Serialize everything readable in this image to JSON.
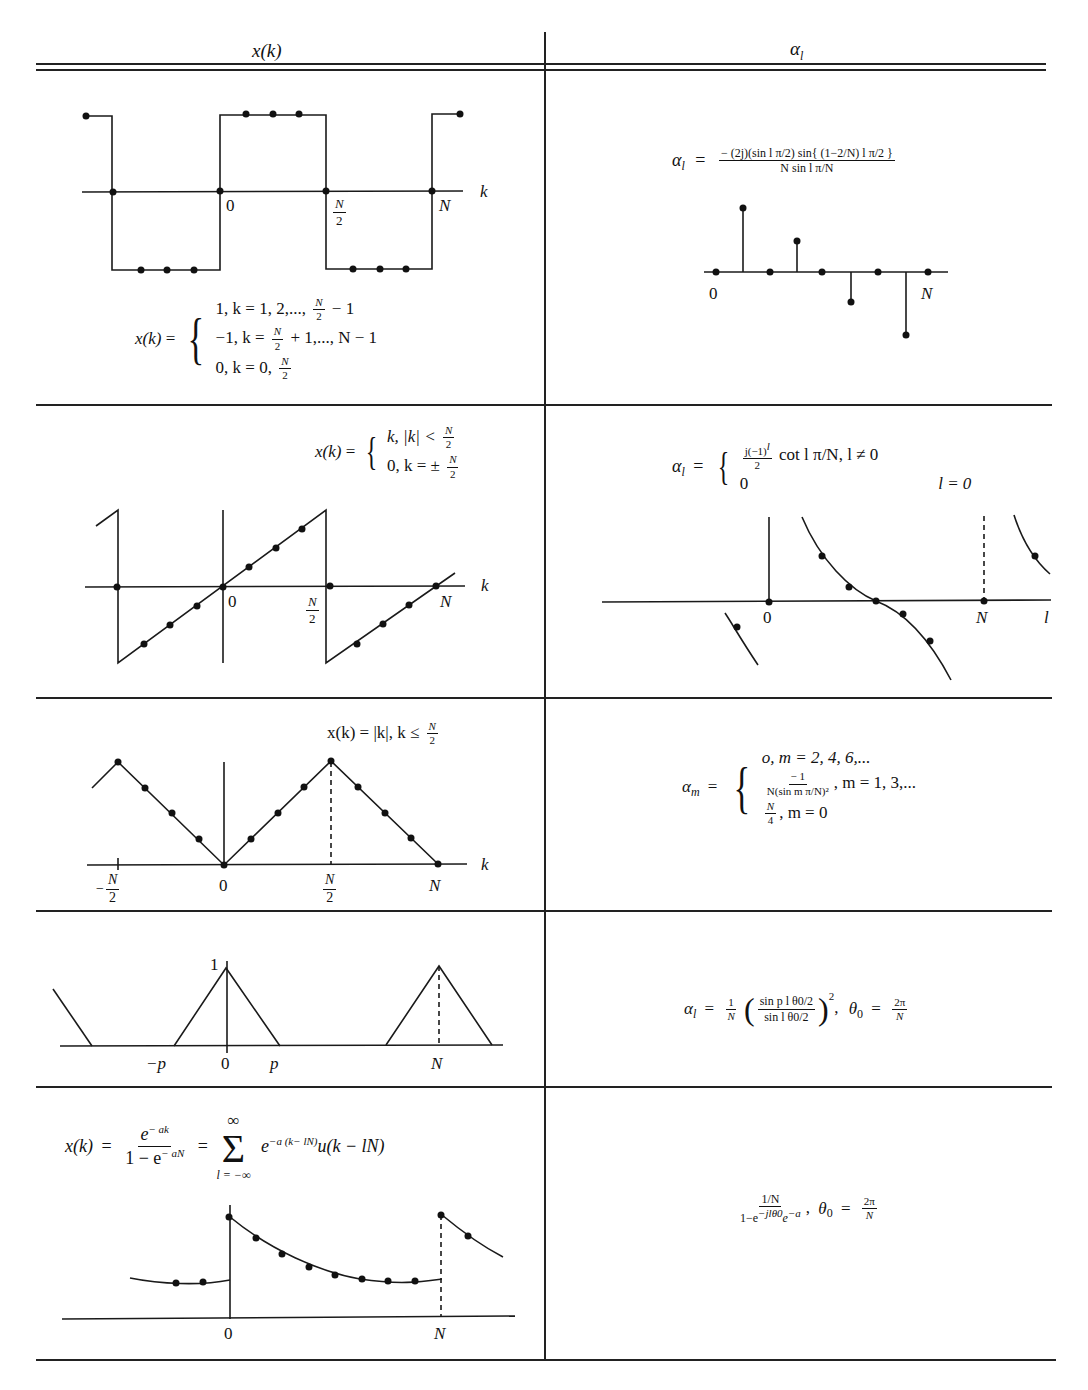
{
  "table": {
    "headers": {
      "left": "x(k)",
      "right": "αl"
    },
    "rows": [
      {
        "left": {
          "figure": "square-wave",
          "axis_labels": {
            "zero": "0",
            "half": "N",
            "half_den": "2",
            "n": "N",
            "k": "k"
          },
          "definition_lhs": "x(k) =",
          "cases": [
            "1, k = 1, 2,..., N/2 − 1",
            "−1, k = N/2 + 1,..., N − 1",
            "0, k = 0, N/2"
          ]
        },
        "right": {
          "formula_lhs": "αl =",
          "formula_num": "− (2j)(sin l π/2) sin{ (1−2/N) l π/2 }",
          "formula_den": "N sin l π/N",
          "figure": "stem-plot",
          "axis_labels": {
            "zero": "0",
            "n": "N"
          }
        }
      },
      {
        "left": {
          "figure": "sawtooth",
          "definition_lhs": "x(k) =",
          "cases": [
            "k, |k| < N/2",
            "0, k = ± N/2"
          ],
          "axis_labels": {
            "zero": "0",
            "half": "N",
            "half_den": "2",
            "n": "N",
            "k": "k"
          }
        },
        "right": {
          "formula_lhs": "αl =",
          "cases": [
            "j(−1)^l / 2  cot l π/N,  l ≠ 0",
            "0   l = 0"
          ],
          "figure": "cotangent",
          "axis_labels": {
            "zero": "0",
            "n": "N",
            "l": "l"
          }
        }
      },
      {
        "left": {
          "figure": "triangle-wave",
          "definition": "x(k) = |k|, k ≤ N/2",
          "axis_labels": {
            "neg_half": "−N/2",
            "zero": "0",
            "half": "N/2",
            "n": "N",
            "k": "k"
          }
        },
        "right": {
          "formula_lhs": "αm =",
          "cases": [
            "o, m = 2, 4, 6,...",
            "−1 / N(sin m π/N)² ,  m = 1, 3,...",
            "N/4 ,  m = 0"
          ]
        }
      },
      {
        "left": {
          "figure": "triangle-pulses",
          "axis_labels": {
            "one": "1",
            "neg_p": "−p",
            "zero": "0",
            "p": "p",
            "n": "N"
          }
        },
        "right": {
          "formula": "αl = 1/N ( sin p l θ0/2 / sin l θ0/2 )²,  θ0 = 2π/N"
        }
      },
      {
        "left": {
          "definition": "x(k) = e^(−ak) / (1 − e^(−aN)) = Σ_{l=−∞}^{∞} e^(−a(k−lN)) u(k − lN)",
          "figure": "periodic-exponential",
          "axis_labels": {
            "zero": "0",
            "n": "N"
          }
        },
        "right": {
          "formula": "(1/N) / (1 − e^(−j l θ0) e^(−a)),  θ0 = 2π/N"
        }
      }
    ]
  },
  "text": {
    "xk": "x(k)",
    "eq": "=",
    "alpha": "α",
    "l": "l",
    "m": "m",
    "zero": "0",
    "N": "N",
    "two": "2",
    "k": "k",
    "one": "1",
    "p": "p",
    "neg_p": "−p",
    "neg_half_sign": "−",
    "four": "4",
    "r1_case1_a": "1, k = 1, 2,...,",
    "r1_case1_b": "− 1",
    "r1_case2_a": "−1, k =",
    "r1_case2_b": "+ 1,..., N − 1",
    "r1_case3_a": "0, k = 0,",
    "r1_alpha_num": "− (2j)(sin l π/2) sin{ (1−2/N) l π/2 }",
    "r1_alpha_den": "N sin l π/N",
    "r2_case1_a": "k, |k| <",
    "r2_case2_a": "0, k = ±",
    "r2_alpha_c1_num": "j(−1)",
    "r2_alpha_c1_sup": "l",
    "r2_alpha_c1_den": "2",
    "r2_alpha_c1_b": "cot l π/N,  l ≠ 0",
    "r2_alpha_c2_a": "0",
    "r2_alpha_c2_b": "l = 0",
    "r3_def_a": "x(k) = |k|,  k  ≤",
    "r3_c1": "o, m = 2, 4, 6,...",
    "r3_c2_num": "− 1",
    "r3_c2_den": "N(sin m π/N)²",
    "r3_c2_b": ",   m = 1, 3,...",
    "r3_c3_b": ",   m = 0",
    "r4_frac_num": "sin p l θ0/2",
    "r4_frac_den": "sin l θ0/2",
    "r4_theta": "θ",
    "r4_theta_sub": "0",
    "two_pi": "2π",
    "r5_num": "e",
    "r5_num_sup": "− ak",
    "r5_den": "1 − e",
    "r5_den_sup": "− aN",
    "r5_sum_top": "∞",
    "r5_sum_bot": "l = −∞",
    "r5_sum_sym": "Σ",
    "r5_term": "e",
    "r5_term_sup": "−a (k− lN)",
    "r5_term_b": "u(k − lN)",
    "r5_alpha_num": "1/N",
    "r5_alpha_den": "1−e",
    "r5_alpha_den_sup": "−jlθ0",
    "r5_alpha_den_b": "e",
    "r5_alpha_den_sup2": "−a"
  }
}
